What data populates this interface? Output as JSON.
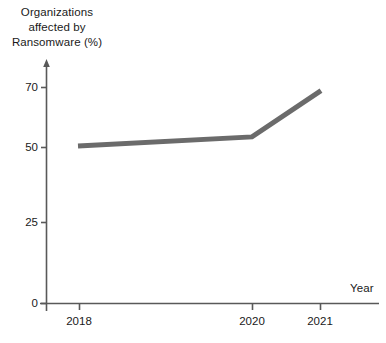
{
  "chart_data": {
    "type": "line",
    "title": "",
    "ylabel": "Organizations affected by Ransomware (%)",
    "ylabel_lines": [
      "Organizations",
      "affected by",
      "Ransomware (%)"
    ],
    "xlabel": "Year",
    "x": [
      2018,
      2020,
      2021
    ],
    "categories": [
      "2018",
      "2020",
      "2021"
    ],
    "values": [
      51,
      54,
      69
    ],
    "series": [
      {
        "name": "Organizations affected by Ransomware (%)",
        "values": [
          51,
          54,
          69
        ],
        "color": "#6b6b6b"
      }
    ],
    "ylim": [
      0,
      75
    ],
    "yticks": [
      0,
      25,
      50,
      70
    ],
    "ytick_labels": [
      "0",
      "25",
      "50",
      "70"
    ],
    "xticks": [
      2018,
      2020,
      2021
    ],
    "xtick_labels": [
      "2018",
      "2020",
      "2021"
    ],
    "grid": false,
    "legend": false,
    "axis_color": "#595959",
    "line_color": "#6b6b6b",
    "line_width": 5,
    "y_axis_arrow": true
  },
  "labels": {
    "y_title_line1": "Organizations",
    "y_title_line2": "affected by",
    "y_title_line3": "Ransomware (%)",
    "x_title": "Year",
    "ytick_70": "70",
    "ytick_50": "50",
    "ytick_25": "25",
    "ytick_0": "0",
    "xtick_2018": "2018",
    "xtick_2020": "2020",
    "xtick_2021": "2021"
  }
}
